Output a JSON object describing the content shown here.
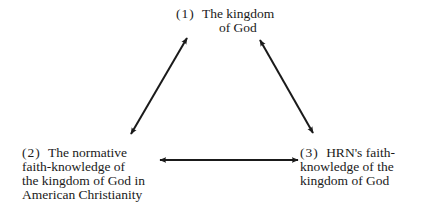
{
  "diagram": {
    "type": "triangle",
    "nodes": [
      {
        "id": 1,
        "number": "(1)",
        "lines": [
          "The kingdom",
          "of God"
        ]
      },
      {
        "id": 2,
        "number": "(2)",
        "lines": [
          "The normative",
          "faith-knowledge of",
          "the kingdom of God in",
          "American Christianity"
        ]
      },
      {
        "id": 3,
        "number": "(3)",
        "lines": [
          "HRN's faith-",
          "knowledge of the",
          "kingdom of God"
        ]
      }
    ],
    "edges": [
      {
        "from": 1,
        "to": 2,
        "style": "double-headed-arrow"
      },
      {
        "from": 1,
        "to": 3,
        "style": "double-headed-arrow"
      },
      {
        "from": 2,
        "to": 3,
        "style": "double-headed-arrow"
      }
    ],
    "colors": {
      "ink": "#1a1a1a",
      "background": "#ffffff"
    }
  }
}
